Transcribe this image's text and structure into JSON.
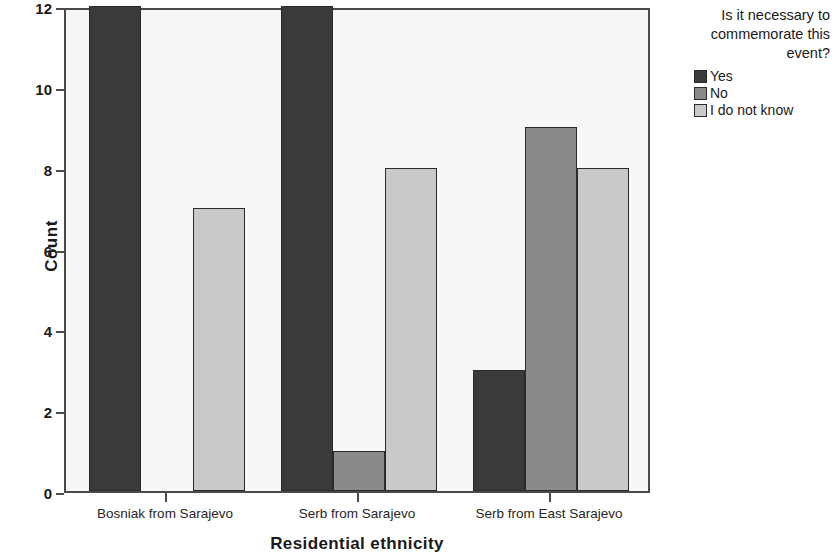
{
  "chart_data": {
    "type": "bar",
    "title": "",
    "xlabel": "Residential ethnicity",
    "ylabel": "Count",
    "categories": [
      "Bosniak from Sarajevo",
      "Serb from Sarajevo",
      "Serb from East Sarajevo"
    ],
    "series": [
      {
        "name": "Yes",
        "values": [
          12,
          12,
          3
        ],
        "color": "#3a3a3a"
      },
      {
        "name": "No",
        "values": [
          0,
          1,
          9
        ],
        "color": "#8a8a8a"
      },
      {
        "name": "I do not know",
        "values": [
          7,
          8,
          8
        ],
        "color": "#c9c9c9"
      }
    ],
    "ylim": [
      0,
      12
    ],
    "yticks": [
      0,
      2,
      4,
      6,
      8,
      10,
      12
    ],
    "ytick_labels": [
      "0",
      "2",
      "4",
      "6",
      "8",
      "10",
      "12"
    ],
    "grid": false,
    "legend_position": "right",
    "legend_title": "Is it necessary to commemorate this event?",
    "bar_border_color": "#2b2b2b",
    "plot_background": "#f7f7f7",
    "axis_color": "#4a4a4a"
  },
  "axes": {
    "y_title": "Count",
    "x_title": "Residential ethnicity"
  },
  "legend": {
    "title": "Is it necessary to commemorate this event?",
    "items": [
      {
        "label": "Yes",
        "color": "#3a3a3a"
      },
      {
        "label": "No",
        "color": "#8a8a8a"
      },
      {
        "label": "I do not know",
        "color": "#c9c9c9"
      }
    ]
  }
}
